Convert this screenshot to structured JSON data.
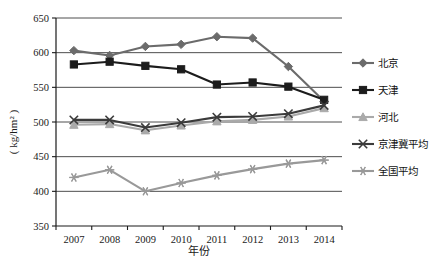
{
  "chart_data": {
    "type": "line",
    "title": "",
    "xlabel": "年份",
    "ylabel": "( kg/hm² )",
    "x": [
      "2007",
      "2008",
      "2009",
      "2010",
      "2011",
      "2012",
      "2013",
      "2014"
    ],
    "categories": [
      "2007",
      "2008",
      "2009",
      "2010",
      "2011",
      "2012",
      "2013",
      "2014"
    ],
    "ylim": [
      350,
      650
    ],
    "ytick_step": 50,
    "yticks": [
      "650",
      "600",
      "550",
      "500",
      "450",
      "400",
      "350"
    ],
    "grid": true,
    "legend_position": "right",
    "series": [
      {
        "name": "北京",
        "marker": "diamond",
        "color": "#6b6b6b",
        "values": [
          603,
          596,
          609,
          612,
          623,
          621,
          580,
          530
        ]
      },
      {
        "name": "天津",
        "marker": "square",
        "color": "#1c1c1c",
        "values": [
          583,
          587,
          581,
          576,
          554,
          557,
          551,
          532
        ]
      },
      {
        "name": "河北",
        "marker": "triangle",
        "color": "#aaaaaa",
        "values": [
          496,
          497,
          488,
          495,
          501,
          503,
          508,
          520
        ]
      },
      {
        "name": "京津冀平均",
        "marker": "x",
        "color": "#3b3b3b",
        "values": [
          503,
          503,
          492,
          499,
          507,
          508,
          512,
          524
        ]
      },
      {
        "name": "全国平均",
        "marker": "asterisk",
        "color": "#999999",
        "values": [
          420,
          431,
          400,
          412,
          423,
          432,
          440,
          445
        ]
      }
    ]
  }
}
